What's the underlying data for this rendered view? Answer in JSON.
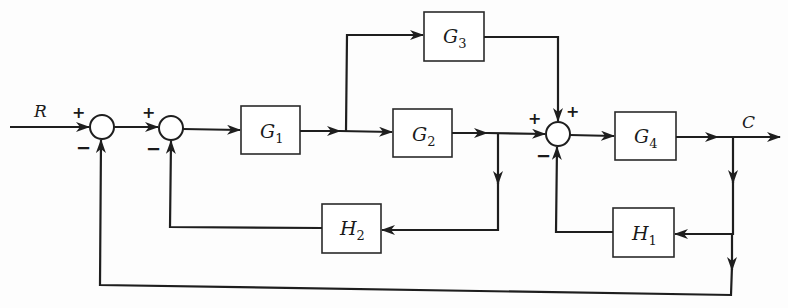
{
  "diagram": {
    "type": "block-diagram",
    "input": {
      "label": "R"
    },
    "output": {
      "label": "C"
    },
    "blocks": [
      {
        "id": "G1",
        "base": "G",
        "sub": "1"
      },
      {
        "id": "G2",
        "base": "G",
        "sub": "2"
      },
      {
        "id": "G3",
        "base": "G",
        "sub": "3"
      },
      {
        "id": "G4",
        "base": "G",
        "sub": "4"
      },
      {
        "id": "H1",
        "base": "H",
        "sub": "1"
      },
      {
        "id": "H2",
        "base": "H",
        "sub": "2"
      }
    ],
    "junctions": [
      {
        "id": "S1",
        "signs": {
          "left": "+",
          "bottom": "−"
        }
      },
      {
        "id": "S2",
        "signs": {
          "left": "+",
          "bottom": "−"
        }
      },
      {
        "id": "S3",
        "signs": {
          "left": "+",
          "top": "+",
          "bottom": "−"
        }
      }
    ],
    "connections": [
      "R → S1(+)",
      "S1 → S2(+)",
      "S2 → G1",
      "G1 → G2",
      "G1 → G3",
      "G2 → S3(+)",
      "G3 → S3(+)",
      "G2 output → H2 → S2(−)",
      "S3 → G4",
      "G4 → C",
      "C → H1 → S3(−)",
      "C → S1(−)"
    ]
  }
}
